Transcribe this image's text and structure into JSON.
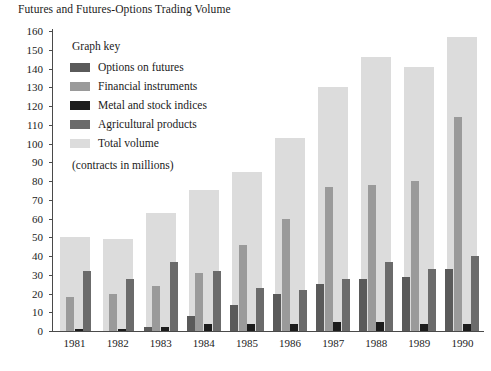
{
  "chart_data": {
    "type": "bar",
    "title": "Futures and Futures-Options Trading Volume",
    "xlabel": "",
    "ylabel": "",
    "ylim": [
      0,
      160
    ],
    "ytick_step": 10,
    "yticks": [
      0,
      10,
      20,
      30,
      40,
      50,
      60,
      70,
      80,
      90,
      100,
      110,
      120,
      130,
      140,
      150,
      160
    ],
    "grid": false,
    "legend_position": "inside-upper-left",
    "legend_title": "Graph key",
    "note": "(contracts in millions)",
    "categories": [
      "1981",
      "1982",
      "1983",
      "1984",
      "1985",
      "1986",
      "1987",
      "1988",
      "1989",
      "1990"
    ],
    "series": [
      {
        "name": "Options on futures",
        "color": "#5a5a5a",
        "values": [
          0,
          0,
          2,
          8,
          14,
          20,
          25,
          28,
          29,
          33
        ]
      },
      {
        "name": "Financial instruments",
        "color": "#9a9a9a",
        "values": [
          18,
          20,
          24,
          31,
          46,
          60,
          77,
          78,
          80,
          114
        ]
      },
      {
        "name": "Metal and stock indices",
        "color": "#1c1c1c",
        "values": [
          1,
          1,
          2,
          4,
          4,
          4,
          5,
          5,
          4,
          4
        ]
      },
      {
        "name": "Agricultural products",
        "color": "#6b6b6b",
        "values": [
          32,
          28,
          37,
          32,
          23,
          22,
          28,
          37,
          33,
          40
        ]
      },
      {
        "name": "Total volume",
        "color": "#dcdcdc",
        "values": [
          50,
          49,
          63,
          75,
          85,
          103,
          130,
          146,
          141,
          157
        ]
      }
    ]
  }
}
